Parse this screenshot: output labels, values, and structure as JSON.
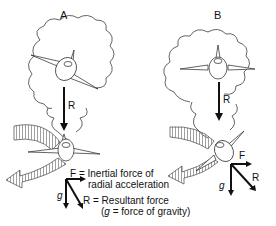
{
  "panels": [
    {
      "label": "A",
      "thought_vector_label": "R"
    },
    {
      "label": "B",
      "thought_vector_label": "R",
      "force_labels": {
        "F": "F",
        "g": "g",
        "R": "R"
      }
    }
  ],
  "legend": {
    "g_symbol": "g",
    "F_line1": "F = Inertial force of",
    "F_line2": "radial acceleration",
    "R_line1": "R = Resultant force",
    "R_line2_open": "(",
    "R_line2_g": "g",
    "R_line2_rest": " = force of gravity)"
  },
  "colors": {
    "line": "#111111",
    "hatch": "#888888",
    "background": "#ffffff"
  }
}
